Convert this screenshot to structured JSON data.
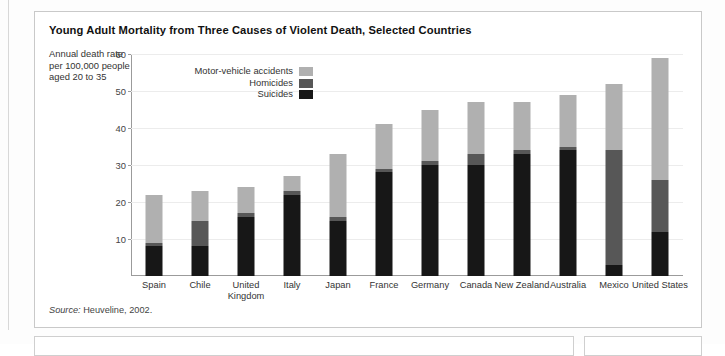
{
  "figure": {
    "title": "Young Adult Mortality from Three Causes of Violent Death, Selected Countries",
    "y_axis_caption": "Annual death rate per 100,000 people aged 20 to 35",
    "source_prefix": "Source:",
    "source_text": " Heuveline, 2002."
  },
  "legend": {
    "items": [
      {
        "label": "Motor-vehicle accidents",
        "color": "#b0b0b0",
        "key": "motor_vehicle"
      },
      {
        "label": "Homicides",
        "color": "#575757",
        "key": "homicides"
      },
      {
        "label": "Suicides",
        "color": "#171717",
        "key": "suicides"
      }
    ]
  },
  "chart_data": {
    "type": "bar",
    "stacked": true,
    "title": "Young Adult Mortality from Three Causes of Violent Death, Selected Countries",
    "xlabel": "",
    "ylabel": "Annual death rate per 100,000 people aged 20 to 35",
    "ylim": [
      0,
      60
    ],
    "yticks": [
      10,
      20,
      30,
      40,
      50,
      60
    ],
    "grid": true,
    "legend_position": "inside-top-left",
    "categories": [
      "Spain",
      "Chile",
      "United Kingdom",
      "Italy",
      "Japan",
      "France",
      "Germany",
      "Canada",
      "New Zealand",
      "Australia",
      "Mexico",
      "United States"
    ],
    "series": [
      {
        "name": "Suicides",
        "color": "#171717",
        "values": [
          8,
          8,
          16,
          22,
          15,
          28,
          30,
          30,
          33,
          34,
          3,
          12
        ]
      },
      {
        "name": "Homicides",
        "color": "#575757",
        "values": [
          1,
          7,
          1,
          1,
          1,
          1,
          1,
          3,
          1,
          1,
          31,
          14
        ]
      },
      {
        "name": "Motor-vehicle accidents",
        "color": "#b0b0b0",
        "values": [
          13,
          8,
          7,
          4,
          17,
          12,
          14,
          14,
          13,
          14,
          18,
          33
        ]
      }
    ],
    "totals": [
      22,
      23,
      24,
      27,
      33,
      41,
      45,
      47,
      47,
      49,
      52,
      59
    ]
  }
}
